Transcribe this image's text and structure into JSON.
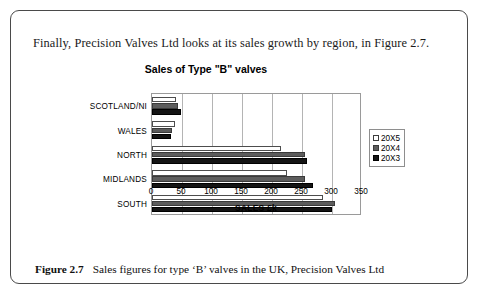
{
  "intro_text": "Finally, Precision Valves Ltd looks at its sales growth by region, in Figure 2.7.",
  "caption": {
    "label": "Figure 2.7",
    "text": "Sales figures for type ‘B’ valves in the UK, Precision Valves Ltd"
  },
  "chart_data": {
    "type": "bar",
    "orientation": "horizontal",
    "title": "Sales of Type \"B\" valves",
    "xlabel": "SALES £k",
    "ylabel": "",
    "xlim": [
      0,
      350
    ],
    "xticks": [
      0,
      50,
      100,
      150,
      200,
      250,
      300,
      350
    ],
    "grid": true,
    "legend_position": "right",
    "categories": [
      "SCOTLAND/NI",
      "WALES",
      "NORTH",
      "MIDLANDS",
      "SOUTH"
    ],
    "series": [
      {
        "name": "20X5",
        "color": "#ffffff",
        "values": [
          40,
          38,
          215,
          225,
          285
        ]
      },
      {
        "name": "20X4",
        "color": "#5c5c5c",
        "values": [
          44,
          34,
          255,
          255,
          305
        ]
      },
      {
        "name": "20X3",
        "color": "#141414",
        "values": [
          48,
          32,
          258,
          268,
          300
        ]
      }
    ]
  }
}
